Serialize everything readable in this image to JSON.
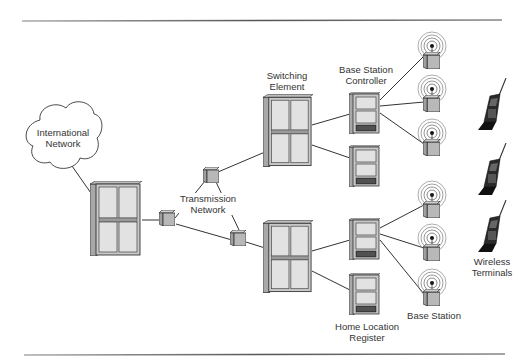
{
  "diagram": {
    "labels": {
      "international_network": [
        "International",
        "Network"
      ],
      "transmission_network": [
        "Transmission",
        "Network"
      ],
      "switching_element": [
        "Switching",
        "Element"
      ],
      "base_station_controller": [
        "Base Station",
        "Controller"
      ],
      "home_location_register": [
        "Home Location",
        "Register"
      ],
      "base_station": [
        "Base Station"
      ],
      "wireless_terminals": [
        "Wireless",
        "Terminals"
      ]
    },
    "colors": {
      "line": "#333333",
      "cabinet_fill": "#c8c8c8",
      "panel_fill": "#e4e4e4",
      "dark": "#1a1a1a",
      "rule": "#777777"
    },
    "nodes": {
      "cloud": {
        "x": 25,
        "y": 103,
        "w": 76,
        "h": 70
      },
      "msc_left": {
        "x": 90,
        "y": 181,
        "w": 52,
        "h": 75
      },
      "switch_top": {
        "x": 263,
        "y": 94,
        "w": 50,
        "h": 73
      },
      "switch_bottom": {
        "x": 263,
        "y": 220,
        "w": 50,
        "h": 73
      },
      "bsc_top": {
        "x": 349,
        "y": 92,
        "w": 31,
        "h": 42
      },
      "bsc_mid": {
        "x": 349,
        "y": 145,
        "w": 31,
        "h": 42
      },
      "bsc_bottom": {
        "x": 349,
        "y": 218,
        "w": 31,
        "h": 42
      },
      "hlr": {
        "x": 349,
        "y": 273,
        "w": 31,
        "h": 42
      },
      "tx_nodes": [
        {
          "x": 211,
          "y": 175
        },
        {
          "x": 167,
          "y": 218
        },
        {
          "x": 238,
          "y": 238
        }
      ],
      "base_stations": [
        {
          "x": 432,
          "y": 46
        },
        {
          "x": 432,
          "y": 89
        },
        {
          "x": 432,
          "y": 133
        },
        {
          "x": 432,
          "y": 195
        },
        {
          "x": 432,
          "y": 238
        },
        {
          "x": 432,
          "y": 283
        }
      ],
      "phones": [
        {
          "x": 478,
          "y": 78
        },
        {
          "x": 478,
          "y": 143
        },
        {
          "x": 478,
          "y": 200
        }
      ]
    }
  }
}
